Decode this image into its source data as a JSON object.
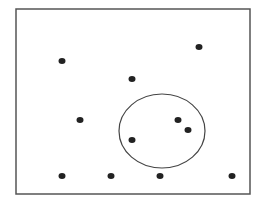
{
  "diagram": {
    "frame": {
      "x": 16,
      "y": 9,
      "width": 234,
      "height": 185,
      "stroke": "#555555"
    },
    "circle": {
      "cx": 162,
      "cy": 131,
      "rx": 43,
      "ry": 37,
      "stroke": "#444444"
    },
    "points": [
      {
        "x": 62,
        "y": 61
      },
      {
        "x": 199,
        "y": 47
      },
      {
        "x": 132,
        "y": 79
      },
      {
        "x": 80,
        "y": 120
      },
      {
        "x": 178,
        "y": 120
      },
      {
        "x": 188,
        "y": 130
      },
      {
        "x": 132,
        "y": 140
      },
      {
        "x": 62,
        "y": 176
      },
      {
        "x": 111,
        "y": 176
      },
      {
        "x": 160,
        "y": 176
      },
      {
        "x": 232,
        "y": 176
      }
    ],
    "point_color": "#222222",
    "point_rx": 3.5,
    "point_ry": 3
  }
}
